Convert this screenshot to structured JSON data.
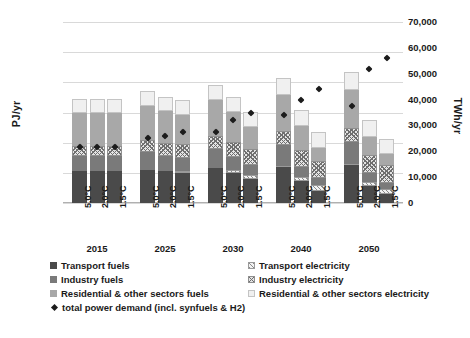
{
  "chart_data": {
    "type": "bar",
    "title": "",
    "stacked": true,
    "grid": true,
    "ylabel": "PJ/yr",
    "ylabel_secondary": "TWh/yr",
    "xlabel": "",
    "ylim": [
      0,
      600000
    ],
    "yticks": [
      "0",
      "100,000",
      "200,000",
      "300,000",
      "400,000",
      "500,000",
      "600,000"
    ],
    "ylim_secondary": [
      0,
      70000
    ],
    "yticks_secondary": [
      "0",
      "10,000",
      "20,000",
      "30,000",
      "40,000",
      "50,000",
      "60,000",
      "70,000"
    ],
    "group_labels": [
      "2015",
      "2025",
      "2030",
      "2040",
      "2050"
    ],
    "scenarios": [
      "5.0°C",
      "2.0°C",
      "1.5°C"
    ],
    "categories": [
      "2015 5.0°C",
      "2015 2.0°C",
      "2015 1.5°C",
      "2025 5.0°C",
      "2025 2.0°C",
      "2025 1.5°C",
      "2030 5.0°C",
      "2030 2.0°C",
      "2030 1.5°C",
      "2040 5.0°C",
      "2040 2.0°C",
      "2040 1.5°C",
      "2050 5.0°C",
      "2050 2.0°C",
      "2050 1.5°C"
    ],
    "series": [
      {
        "name": "Transport fuels",
        "key": "transport_fuel",
        "style": "solid-dark",
        "color": "#4a4a4a",
        "values": [
          105000,
          105000,
          105000,
          110000,
          105000,
          100000,
          115000,
          100000,
          78000,
          120000,
          72000,
          40000,
          125000,
          55000,
          30000
        ]
      },
      {
        "name": "Transport electricity",
        "key": "transport_elec",
        "style": "hatch-light",
        "color": "#f2f2f2",
        "values": [
          0,
          0,
          0,
          0,
          2000,
          5000,
          0,
          8000,
          14000,
          3000,
          14000,
          20000,
          5000,
          16000,
          18000
        ]
      },
      {
        "name": "Industry fuels",
        "key": "industry_fuel",
        "style": "solid-mid",
        "color": "#7a7a7a",
        "values": [
          50000,
          50000,
          50000,
          58000,
          50000,
          45000,
          65000,
          45000,
          35000,
          70000,
          35000,
          22000,
          72000,
          30000,
          18000
        ]
      },
      {
        "name": "Industry electricity",
        "key": "industry_elec",
        "style": "hatch-cross",
        "color": "#e4e4e4",
        "values": [
          35000,
          35000,
          35000,
          40000,
          42000,
          45000,
          42000,
          50000,
          52000,
          45000,
          55000,
          58000,
          48000,
          58000,
          60000
        ]
      },
      {
        "name": "Residential & other sectors fuels",
        "key": "resid_fuel",
        "style": "solid-light",
        "color": "#a8a8a8",
        "values": [
          110000,
          110000,
          110000,
          115000,
          105000,
          98000,
          118000,
          100000,
          72000,
          120000,
          78000,
          42000,
          125000,
          60000,
          35000
        ]
      },
      {
        "name": "Residential & other sectors electricity",
        "key": "resid_elec",
        "style": "plain-light",
        "color": "#f0f0f0",
        "values": [
          45000,
          45000,
          45000,
          48000,
          48000,
          48000,
          50000,
          50000,
          52000,
          55000,
          55000,
          55000,
          58000,
          55000,
          52000
        ]
      }
    ],
    "totals_pj": [
      345000,
      345000,
      345000,
      371000,
      352000,
      341000,
      390000,
      353000,
      303000,
      413000,
      309000,
      237000,
      433000,
      274000,
      213000
    ],
    "marker_series": {
      "name": "total power demand (incl. synfuels & H2)",
      "marker": "diamond",
      "color": "#1c1c1c",
      "unit": "TWh/yr",
      "values_twh": [
        21500,
        21500,
        21500,
        25000,
        26000,
        27500,
        27500,
        32000,
        35000,
        34000,
        40000,
        44000,
        37500,
        52000,
        56000
      ]
    }
  },
  "legend": {
    "left_column": [
      {
        "label": "Transport fuels",
        "swatch": "solid-dark"
      },
      {
        "label": "Industry fuels",
        "swatch": "solid-mid"
      },
      {
        "label": "Residential & other sectors fuels",
        "swatch": "solid-light"
      },
      {
        "label": "total power demand (incl. synfuels & H2)",
        "swatch": "diamond"
      }
    ],
    "right_column": [
      {
        "label": "Transport electricity",
        "swatch": "hatch-light"
      },
      {
        "label": "Industry electricity",
        "swatch": "hatch-cross"
      },
      {
        "label": "Residential & other sectors electricity",
        "swatch": "plain-light"
      }
    ]
  }
}
